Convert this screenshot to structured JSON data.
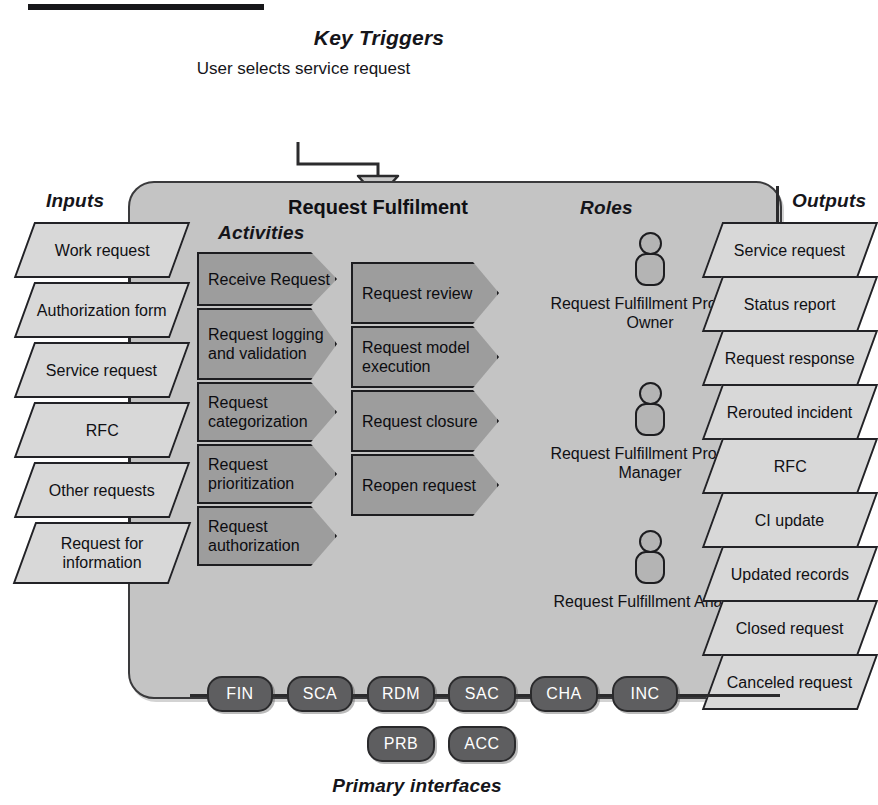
{
  "diagram": {
    "title": "Request Fulfilment",
    "key_triggers_label": "Key Triggers",
    "trigger_text": "User selects service request",
    "inputs_label": "Inputs",
    "outputs_label": "Outputs",
    "activities_label": "Activities",
    "roles_label": "Roles",
    "primary_interfaces_label": "Primary interfaces"
  },
  "inputs": [
    {
      "label": "Work request"
    },
    {
      "label": "Authorization form"
    },
    {
      "label": "Service request"
    },
    {
      "label": "RFC"
    },
    {
      "label": "Other requests"
    },
    {
      "label": "Request for information"
    }
  ],
  "activities_column_1": [
    {
      "label": "Receive Request"
    },
    {
      "label": "Request logging and validation"
    },
    {
      "label": "Request categorization"
    },
    {
      "label": "Request prioritization"
    },
    {
      "label": "Request authorization"
    }
  ],
  "activities_column_2": [
    {
      "label": "Request review"
    },
    {
      "label": "Request model execution"
    },
    {
      "label": "Request closure"
    },
    {
      "label": "Reopen request"
    }
  ],
  "roles": [
    {
      "label": "Request Fulfillment Process Owner"
    },
    {
      "label": "Request Fulfillment Process Manager"
    },
    {
      "label": "Request Fulfillment Analyst"
    }
  ],
  "outputs": [
    {
      "label": "Service request"
    },
    {
      "label": "Status report"
    },
    {
      "label": "Request response"
    },
    {
      "label": "Rerouted incident"
    },
    {
      "label": "RFC"
    },
    {
      "label": "CI update"
    },
    {
      "label": "Updated records"
    },
    {
      "label": "Closed request"
    },
    {
      "label": "Canceled request"
    }
  ],
  "interfaces_row_1": [
    {
      "label": "FIN"
    },
    {
      "label": "SCA"
    },
    {
      "label": "RDM"
    },
    {
      "label": "SAC"
    },
    {
      "label": "CHA"
    },
    {
      "label": "INC"
    }
  ],
  "interfaces_row_2": [
    {
      "label": "PRB"
    },
    {
      "label": "ACC"
    }
  ],
  "colors": {
    "panel_fill": "#c4c4c4",
    "io_fill": "#d8d8d8",
    "activity_fill": "#9d9d9d",
    "role_fill": "#b4b4b4",
    "pill_fill": "#5e5e60",
    "outline": "#1d1d20"
  }
}
